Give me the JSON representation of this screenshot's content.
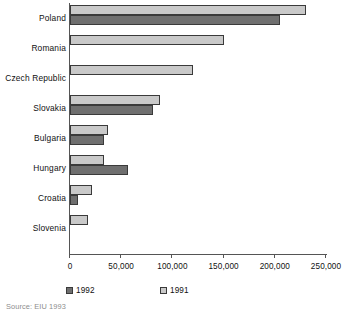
{
  "chart_data": {
    "type": "bar",
    "orientation": "horizontal",
    "title": "",
    "xlabel": "",
    "ylabel": "",
    "xlim": [
      0,
      250000
    ],
    "grid": false,
    "legend_position": "bottom",
    "categories": [
      "Poland",
      "Romania",
      "Czech Republic",
      "Slovakia",
      "Bulgaria",
      "Hungary",
      "Croatia",
      "Slovenia"
    ],
    "tick_labels": [
      "0",
      "50,000",
      "100,000",
      "150,000",
      "200,000",
      "250,000"
    ],
    "tick_values": [
      0,
      50000,
      100000,
      150000,
      200000,
      250000
    ],
    "series": [
      {
        "name": "1991",
        "color": "#c9c9c9",
        "values": [
          230000,
          150000,
          120000,
          88000,
          37000,
          33000,
          21000,
          18000
        ]
      },
      {
        "name": "1992",
        "color": "#6f6f6f",
        "values": [
          205000,
          0,
          0,
          81000,
          33000,
          57000,
          8000,
          0
        ]
      }
    ],
    "source": "Source: EIU 1993"
  },
  "legend": {
    "items": [
      {
        "label": "1992",
        "color": "#6f6f6f"
      },
      {
        "label": "1991",
        "color": "#c9c9c9"
      }
    ]
  }
}
